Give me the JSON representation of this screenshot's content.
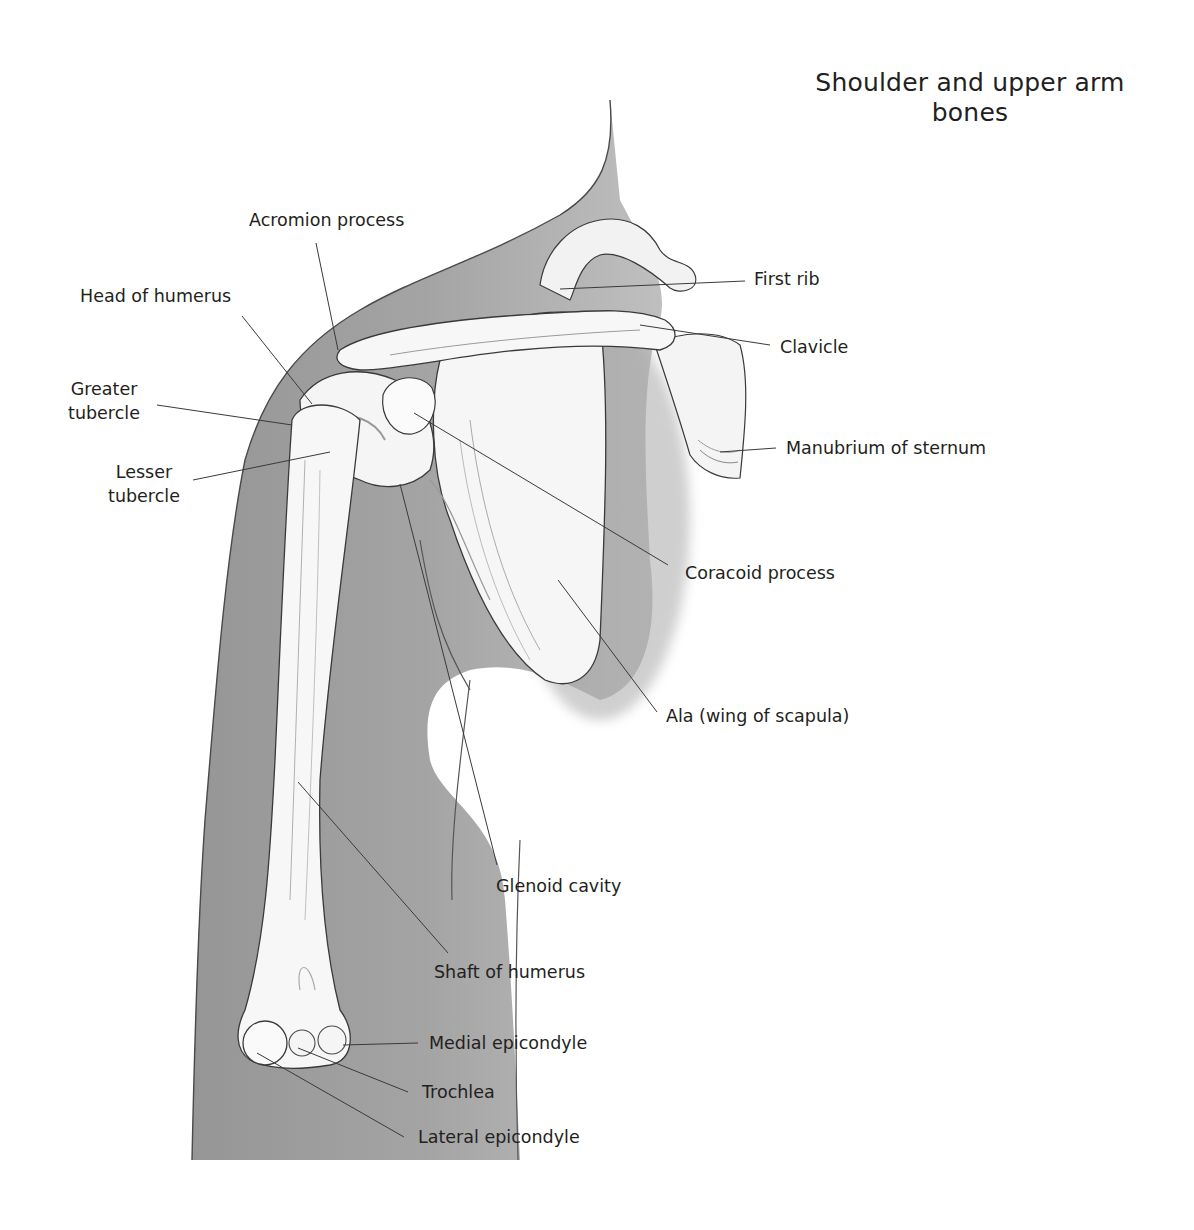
{
  "figure": {
    "title_line1": "Shoulder and upper arm",
    "title_line2": "bones"
  },
  "labels": {
    "acromion_process": "Acromion process",
    "head_of_humerus": "Head of humerus",
    "greater_tubercle_1": "Greater",
    "greater_tubercle_2": "tubercle",
    "lesser_tubercle_1": "Lesser",
    "lesser_tubercle_2": "tubercle",
    "first_rib": "First rib",
    "clavicle": "Clavicle",
    "manubrium_of_sternum": "Manubrium of sternum",
    "coracoid_process": "Coracoid process",
    "ala_wing_of_scapula": "Ala (wing of scapula)",
    "glenoid_cavity": "Glenoid cavity",
    "shaft_of_humerus": "Shaft of humerus",
    "medial_epicondyle": "Medial epicondyle",
    "trochlea": "Trochlea",
    "lateral_epicondyle": "Lateral epicondyle"
  },
  "colors": {
    "background": "#ffffff",
    "body_shadow": "#8f8f8f",
    "bone": "#f4f4f4",
    "outline": "#3a3a3a",
    "text": "#231f20"
  }
}
